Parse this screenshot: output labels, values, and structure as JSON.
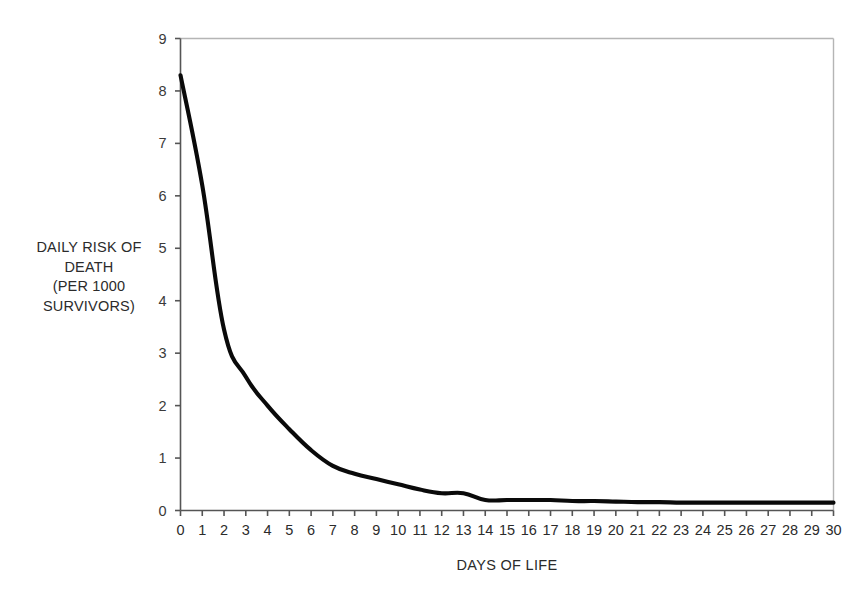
{
  "chart_data": {
    "type": "line",
    "title": "",
    "subtitle": "",
    "xlabel": "DAYS OF LIFE",
    "ylabel": "DAILY RISK OF DEATH (PER 1000 SURVIVORS)",
    "ylabel_lines": [
      "DAILY RISK OF",
      "DEATH",
      "(PER 1000",
      "SURVIVORS)"
    ],
    "xlim": [
      0,
      30
    ],
    "ylim": [
      0,
      9
    ],
    "xticks": [
      0,
      1,
      2,
      3,
      4,
      5,
      6,
      7,
      8,
      9,
      10,
      11,
      12,
      13,
      14,
      15,
      16,
      17,
      18,
      19,
      20,
      21,
      22,
      23,
      24,
      25,
      26,
      27,
      28,
      29,
      30
    ],
    "yticks": [
      0,
      1,
      2,
      3,
      4,
      5,
      6,
      7,
      8,
      9
    ],
    "grid": false,
    "legend": "none",
    "line_color": "#0a0a0a",
    "axis_color": "#555555",
    "frame_color": "#b5b5b5",
    "background": "#ffffff",
    "x": [
      0,
      1,
      2,
      3,
      4,
      5,
      6,
      7,
      8,
      9,
      10,
      11,
      12,
      13,
      14,
      15,
      16,
      17,
      18,
      19,
      20,
      21,
      22,
      23,
      24,
      25,
      26,
      27,
      28,
      29,
      30
    ],
    "values": [
      8.3,
      6.2,
      3.45,
      2.55,
      2.0,
      1.55,
      1.15,
      0.85,
      0.7,
      0.6,
      0.5,
      0.4,
      0.33,
      0.33,
      0.2,
      0.2,
      0.2,
      0.2,
      0.18,
      0.18,
      0.17,
      0.16,
      0.16,
      0.15,
      0.15,
      0.15,
      0.15,
      0.15,
      0.15,
      0.15,
      0.15
    ],
    "series": [
      {
        "name": "Daily risk of death",
        "values": [
          8.3,
          6.2,
          3.45,
          2.55,
          2.0,
          1.55,
          1.15,
          0.85,
          0.7,
          0.6,
          0.5,
          0.4,
          0.33,
          0.33,
          0.2,
          0.2,
          0.2,
          0.2,
          0.18,
          0.18,
          0.17,
          0.16,
          0.16,
          0.15,
          0.15,
          0.15,
          0.15,
          0.15,
          0.15,
          0.15,
          0.15
        ]
      }
    ]
  }
}
